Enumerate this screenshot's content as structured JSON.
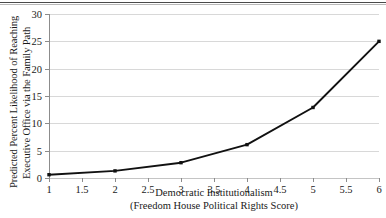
{
  "figure": {
    "name": "predicted-likelihood-line-chart",
    "top_rule": true,
    "background": "#ffffff",
    "line_color": "#111111",
    "marker_color": "#111111",
    "grid_color": "#d8d8d8",
    "axis_color": "#8c8c8c"
  },
  "chart_data": {
    "type": "line",
    "title": "",
    "xlabel": "Democratic Institutionalism",
    "xlabel_line2": "(Freedom House Political Rights Score)",
    "ylabel": "Predicted Percent Likelihood of Reaching",
    "ylabel_line2": "Executive Office via the Family Path",
    "x": [
      1,
      2,
      3,
      4,
      5,
      6
    ],
    "values": [
      0.6,
      1.3,
      2.8,
      6.1,
      12.9,
      25.0
    ],
    "series": [
      {
        "name": "Predicted Percent Likelihood",
        "values": [
          0.6,
          1.3,
          2.8,
          6.1,
          12.9,
          25.0
        ]
      }
    ],
    "xlim": [
      1,
      6
    ],
    "ylim": [
      0,
      30
    ],
    "xticks": [
      1,
      1.5,
      2,
      2.5,
      3,
      3.5,
      4,
      4.5,
      5,
      5.5,
      6
    ],
    "xtick_labels": [
      "1",
      "1.5",
      "2",
      "2.5",
      "3",
      "3.5",
      "4",
      "4.5",
      "5",
      "5.5",
      "6"
    ],
    "yticks": [
      0,
      5,
      10,
      15,
      20,
      25,
      30
    ],
    "ytick_labels": [
      "0",
      "5",
      "10",
      "15",
      "20",
      "25",
      "30"
    ],
    "grid": "horizontal",
    "legend": "none",
    "markers": "filled-square"
  }
}
